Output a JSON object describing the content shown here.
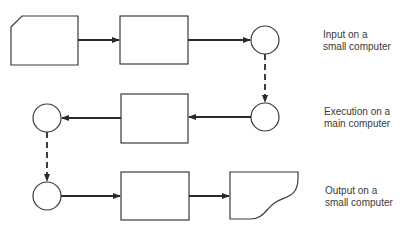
{
  "diagram": {
    "stages": [
      {
        "line1": "Input on a",
        "line2": "small computer"
      },
      {
        "line1": "Execution on a",
        "line2": "main computer"
      },
      {
        "line1": "Output on a",
        "line2": "small computer"
      }
    ],
    "shapes": {
      "input_card": "punched-card",
      "process_boxes": 3,
      "connectors": 4,
      "output_document": "document"
    },
    "colors": {
      "stroke": "#3a3a3a",
      "background": "#ffffff",
      "text": "#3a3a3a"
    }
  }
}
